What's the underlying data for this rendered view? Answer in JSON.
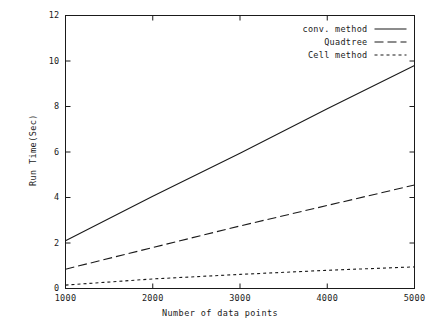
{
  "chart_data": {
    "type": "line",
    "title": "",
    "xlabel": "Number of data points",
    "ylabel": "Run Time(Sec)",
    "xlim": [
      1000,
      5000
    ],
    "ylim": [
      0,
      12
    ],
    "xticks": [
      "1000",
      "2000",
      "3000",
      "4000",
      "5000"
    ],
    "yticks": [
      "0",
      "2",
      "4",
      "6",
      "8",
      "10",
      "12"
    ],
    "xtick_values": [
      1000,
      2000,
      3000,
      4000,
      5000
    ],
    "ytick_values": [
      0,
      2,
      4,
      6,
      8,
      10,
      12
    ],
    "grid": false,
    "legend_position": "top-right-inside",
    "x": [
      1000,
      2000,
      3000,
      4000,
      5000
    ],
    "series": [
      {
        "name": "conv. method",
        "style": "solid",
        "values": [
          2.1,
          4.05,
          5.95,
          7.9,
          9.8
        ]
      },
      {
        "name": "Quadtree",
        "style": "dashed",
        "values": [
          0.85,
          1.8,
          2.75,
          3.65,
          4.55
        ]
      },
      {
        "name": "Cell method",
        "style": "dotted",
        "values": [
          0.15,
          0.42,
          0.62,
          0.8,
          0.95
        ]
      }
    ]
  },
  "legend": {
    "items": [
      {
        "label": "conv. method",
        "style": "solid"
      },
      {
        "label": "Quadtree",
        "style": "dashed"
      },
      {
        "label": "Cell method",
        "style": "dotted"
      }
    ]
  },
  "colors": {
    "ink": "#1a1a1a",
    "background": "#ffffff"
  }
}
